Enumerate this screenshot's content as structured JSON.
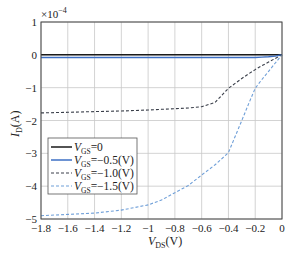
{
  "chart_data": {
    "type": "line",
    "title": "",
    "xlabel": "V_DS(V)",
    "ylabel": "I_D(A)",
    "y_multiplier": "×10^-4",
    "xlim": [
      -1.8,
      0
    ],
    "ylim": [
      -5,
      1
    ],
    "grid": true,
    "legend_position": "lower-left",
    "x_ticks": [
      -1.8,
      -1.6,
      -1.4,
      -1.2,
      -1,
      -0.8,
      -0.6,
      -0.4,
      -0.2,
      0
    ],
    "x_tick_labels": [
      "−1.8",
      "−1.6",
      "−1.4",
      "−1.2",
      "−1",
      "−0.8",
      "−0.6",
      "−0.4",
      "−0.2",
      "0"
    ],
    "y_ticks": [
      1,
      0,
      -1,
      -2,
      -3,
      -4,
      -5
    ],
    "y_tick_labels": [
      "1",
      "0",
      "−1",
      "−2",
      "−3",
      "−4",
      "−5"
    ],
    "x": [
      -1.8,
      -1.6,
      -1.4,
      -1.2,
      -1.0,
      -0.9,
      -0.8,
      -0.7,
      -0.6,
      -0.5,
      -0.4,
      -0.3,
      -0.25,
      -0.2,
      -0.15,
      -0.1,
      -0.05,
      0
    ],
    "series": [
      {
        "name": "V_GS=0",
        "legend_main": "V",
        "legend_sub": "GS",
        "legend_rest": "=0",
        "color": "#1a1a1a",
        "style": "solid",
        "values": [
          0,
          0,
          0,
          0,
          0,
          0,
          0,
          0,
          0,
          0,
          0,
          0,
          0,
          0,
          0,
          0,
          0,
          0
        ]
      },
      {
        "name": "V_GS=-0.5(V)",
        "legend_main": "V",
        "legend_sub": "GS",
        "legend_rest": "=−0.5(V)",
        "color": "#3d6fc4",
        "style": "solid",
        "values": [
          -0.08,
          -0.08,
          -0.08,
          -0.08,
          -0.08,
          -0.08,
          -0.08,
          -0.08,
          -0.08,
          -0.08,
          -0.08,
          -0.08,
          -0.08,
          -0.08,
          -0.07,
          -0.06,
          -0.04,
          0
        ]
      },
      {
        "name": "V_GS=-1.0(V)",
        "legend_main": "V",
        "legend_sub": "GS",
        "legend_rest": "=−1.0(V)",
        "color": "#3a3f4a",
        "style": "dashed",
        "values": [
          -1.77,
          -1.75,
          -1.73,
          -1.71,
          -1.68,
          -1.66,
          -1.64,
          -1.62,
          -1.58,
          -1.45,
          -1.02,
          -0.72,
          -0.58,
          -0.45,
          -0.33,
          -0.22,
          -0.11,
          0
        ]
      },
      {
        "name": "V_GS=-1.5(V)",
        "legend_main": "V",
        "legend_sub": "GS",
        "legend_rest": "=−1.5(V)",
        "color": "#6f9fd8",
        "style": "dashed",
        "values": [
          -4.9,
          -4.86,
          -4.82,
          -4.73,
          -4.57,
          -4.42,
          -4.2,
          -3.98,
          -3.66,
          -3.35,
          -2.98,
          -2.0,
          -1.5,
          -1.02,
          -0.75,
          -0.5,
          -0.25,
          0
        ]
      }
    ]
  }
}
